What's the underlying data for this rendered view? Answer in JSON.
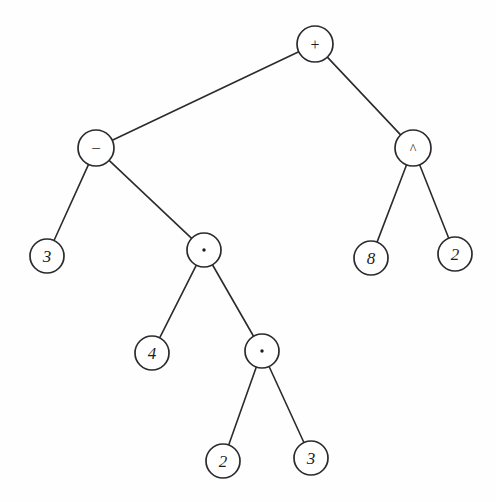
{
  "figure": {
    "kind": "expression-tree",
    "background_color": "#fefefe",
    "stroke_color": "#2b2b2f",
    "text_color": "#1d1d21",
    "width": 496,
    "height": 502
  },
  "nodes": [
    {
      "id": "n-root",
      "label": "+",
      "role": "operator",
      "kind": "plus",
      "cx": 315,
      "cy": 44,
      "r": 18
    },
    {
      "id": "n-minus",
      "label": "−",
      "role": "operator",
      "kind": "minus",
      "cx": 96,
      "cy": 148,
      "r": 18
    },
    {
      "id": "n-caret",
      "label": "^",
      "role": "operator",
      "kind": "caret",
      "cx": 413,
      "cy": 148,
      "r": 18
    },
    {
      "id": "n-three-a",
      "label": "3",
      "role": "operand",
      "kind": "number",
      "cx": 47,
      "cy": 256,
      "r": 17
    },
    {
      "id": "n-dot-1",
      "label": "·",
      "role": "operator",
      "kind": "dot",
      "cx": 204,
      "cy": 250,
      "r": 17
    },
    {
      "id": "n-eight",
      "label": "8",
      "role": "operand",
      "kind": "number",
      "cx": 371,
      "cy": 258,
      "r": 17
    },
    {
      "id": "n-two-a",
      "label": "2",
      "role": "operand",
      "kind": "number",
      "cx": 455,
      "cy": 254,
      "r": 17
    },
    {
      "id": "n-four",
      "label": "4",
      "role": "operand",
      "kind": "number",
      "cx": 152,
      "cy": 353,
      "r": 17
    },
    {
      "id": "n-dot-2",
      "label": "·",
      "role": "operator",
      "kind": "dot",
      "cx": 262,
      "cy": 351,
      "r": 17
    },
    {
      "id": "n-two-b",
      "label": "2",
      "role": "operand",
      "kind": "number",
      "cx": 223,
      "cy": 461,
      "r": 17
    },
    {
      "id": "n-three-b",
      "label": "3",
      "role": "operand",
      "kind": "number",
      "cx": 311,
      "cy": 458,
      "r": 17
    }
  ],
  "edges": [
    {
      "id": "e-root-minus",
      "from": "n-root",
      "to": "n-minus",
      "side": "left"
    },
    {
      "id": "e-root-caret",
      "from": "n-root",
      "to": "n-caret",
      "side": "right"
    },
    {
      "id": "e-minus-three",
      "from": "n-minus",
      "to": "n-three-a",
      "side": "left"
    },
    {
      "id": "e-minus-dot1",
      "from": "n-minus",
      "to": "n-dot-1",
      "side": "right"
    },
    {
      "id": "e-caret-eight",
      "from": "n-caret",
      "to": "n-eight",
      "side": "left"
    },
    {
      "id": "e-caret-two",
      "from": "n-caret",
      "to": "n-two-a",
      "side": "right"
    },
    {
      "id": "e-dot1-four",
      "from": "n-dot-1",
      "to": "n-four",
      "side": "left"
    },
    {
      "id": "e-dot1-dot2",
      "from": "n-dot-1",
      "to": "n-dot-2",
      "side": "right"
    },
    {
      "id": "e-dot2-two",
      "from": "n-dot-2",
      "to": "n-two-b",
      "side": "left"
    },
    {
      "id": "e-dot2-three",
      "from": "n-dot-2",
      "to": "n-three-b",
      "side": "right"
    }
  ]
}
